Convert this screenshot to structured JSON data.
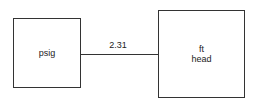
{
  "diagram": {
    "source_box": {
      "label": "psig"
    },
    "target_box": {
      "lines": [
        "ft",
        "head"
      ]
    },
    "connector": {
      "label": "2.31"
    }
  }
}
